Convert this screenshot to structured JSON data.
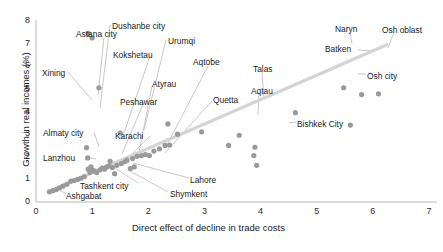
{
  "chart_data": {
    "type": "scatter",
    "title": "",
    "xlabel": "Direct effect of decline in trade costs",
    "ylabel": "Growth in real incomes (%)",
    "xlim": [
      0,
      7
    ],
    "ylim": [
      0,
      8
    ],
    "xticks": [
      "0",
      "1",
      "2",
      "3",
      "4",
      "5",
      "6",
      "7"
    ],
    "yticks": [
      "0",
      "1",
      "2",
      "3",
      "4",
      "5",
      "6",
      "7",
      "8"
    ],
    "grid": false,
    "legend": "none",
    "marker_color": "#9a9a9a",
    "trendline_color": "#d4d4d4",
    "trendline": {
      "x0": 0.22,
      "y0": 0.45,
      "x1": 6.25,
      "y1": 6.95
    },
    "labeled_points": [
      {
        "name": "Xining",
        "x": 0.93,
        "y": 7.45,
        "label_x": 42,
        "label_y": 68,
        "leader": [
          [
            68,
            72
          ],
          [
            92,
            100
          ]
        ]
      },
      {
        "name": "Astana city",
        "x": 1.0,
        "y": 7.25,
        "label_x": 76,
        "label_y": 29,
        "leader": [
          [
            104,
            38
          ],
          [
            98,
            95
          ]
        ]
      },
      {
        "name": "Dushanbe city",
        "x": 1.12,
        "y": 5.05,
        "label_x": 112,
        "label_y": 21,
        "leader": [
          [
            110,
            25
          ],
          [
            100,
            108
          ]
        ]
      },
      {
        "name": "Kokshetau",
        "x": 1.5,
        "y": 3.05,
        "label_x": 113,
        "label_y": 50,
        "leader": [
          [
            150,
            56
          ],
          [
            122,
            139
          ]
        ]
      },
      {
        "name": "Urumqi",
        "x": 2.35,
        "y": 3.45,
        "label_x": 168,
        "label_y": 36,
        "leader": [
          [
            166,
            40
          ],
          [
            144,
            130
          ]
        ]
      },
      {
        "name": "Atyrau",
        "x": 2.02,
        "y": 2.05,
        "label_x": 152,
        "label_y": 79,
        "leader": [
          [
            152,
            86
          ],
          [
            139,
            152
          ]
        ]
      },
      {
        "name": "Aqtobe",
        "x": 2.3,
        "y": 2.5,
        "label_x": 193,
        "label_y": 57,
        "leader": [
          [
            208,
            66
          ],
          [
            167,
            145
          ]
        ]
      },
      {
        "name": "Peshawar",
        "x": 1.32,
        "y": 1.8,
        "label_x": 120,
        "label_y": 97,
        "leader": [
          [
            144,
            102
          ],
          [
            122,
            154
          ]
        ]
      },
      {
        "name": "Quetta",
        "x": 1.75,
        "y": 1.55,
        "label_x": 213,
        "label_y": 95,
        "leader": [
          [
            212,
            101
          ],
          [
            165,
            153
          ]
        ]
      },
      {
        "name": "Karachi",
        "x": 1.22,
        "y": 1.45,
        "label_x": 115,
        "label_y": 131,
        "leader": [
          [
            150,
            136
          ],
          [
            126,
            160
          ]
        ]
      },
      {
        "name": "Almaty city",
        "x": 0.9,
        "y": 2.4,
        "label_x": 43,
        "label_y": 128,
        "leader": [
          [
            94,
            132
          ],
          [
            99,
            147
          ]
        ]
      },
      {
        "name": "Lanzhou",
        "x": 0.93,
        "y": 1.45,
        "label_x": 43,
        "label_y": 153,
        "leader": [
          [
            87,
            157
          ],
          [
            96,
            159
          ]
        ]
      },
      {
        "name": "Tashkent city",
        "x": 1.05,
        "y": 1.35,
        "label_x": 80,
        "label_y": 181,
        "leader": [
          [
            138,
            183
          ],
          [
            112,
            166
          ]
        ]
      },
      {
        "name": "Ashgabat",
        "x": 0.62,
        "y": 0.92,
        "label_x": 66,
        "label_y": 191,
        "leader": [
          [
            66,
            194
          ],
          [
            60,
            190
          ]
        ]
      },
      {
        "name": "Lahore",
        "x": 1.68,
        "y": 1.48,
        "label_x": 190,
        "label_y": 175,
        "leader": [
          [
            189,
            178
          ],
          [
            133,
            163
          ]
        ]
      },
      {
        "name": "Shymkent",
        "x": 1.4,
        "y": 1.25,
        "label_x": 170,
        "label_y": 189,
        "leader": [
          [
            168,
            192
          ],
          [
            128,
            170
          ]
        ]
      },
      {
        "name": "Talas",
        "x": 3.62,
        "y": 2.95,
        "label_x": 253,
        "label_y": 64,
        "leader": [
          [
            262,
            72
          ],
          [
            264,
            98
          ]
        ]
      },
      {
        "name": "Aqtau",
        "x": 3.43,
        "y": 2.5,
        "label_x": 251,
        "label_y": 86,
        "leader": [
          [
            259,
            93
          ],
          [
            258,
            115
          ]
        ]
      },
      {
        "name": "Bishkek City",
        "x": 3.93,
        "y": 1.62,
        "label_x": 297,
        "label_y": 119,
        "leader": [
          [
            296,
            122
          ],
          [
            289,
            123
          ]
        ]
      },
      {
        "name": "Naryn",
        "x": 5.48,
        "y": 5.05,
        "label_x": 335,
        "label_y": 24,
        "leader": [
          [
            350,
            32
          ],
          [
            352,
            44
          ]
        ]
      },
      {
        "name": "Batken",
        "x": 5.8,
        "y": 4.75,
        "label_x": 325,
        "label_y": 44,
        "leader": [
          [
            358,
            50
          ],
          [
            374,
            51
          ]
        ]
      },
      {
        "name": "Osh oblast",
        "x": 6.1,
        "y": 4.78,
        "label_x": 382,
        "label_y": 25,
        "leader": [
          [
            394,
            32
          ],
          [
            388,
            48
          ]
        ]
      },
      {
        "name": "Osh city",
        "x": 5.6,
        "y": 3.4,
        "label_x": 367,
        "label_y": 71,
        "leader": [
          [
            366,
            74
          ],
          [
            358,
            74
          ]
        ]
      }
    ],
    "all_points": [
      {
        "x": 0.24,
        "y": 0.45
      },
      {
        "x": 0.3,
        "y": 0.5
      },
      {
        "x": 0.36,
        "y": 0.55
      },
      {
        "x": 0.42,
        "y": 0.62
      },
      {
        "x": 0.48,
        "y": 0.7
      },
      {
        "x": 0.55,
        "y": 0.78
      },
      {
        "x": 0.62,
        "y": 0.92
      },
      {
        "x": 0.68,
        "y": 0.95
      },
      {
        "x": 0.74,
        "y": 1.0
      },
      {
        "x": 0.8,
        "y": 1.05
      },
      {
        "x": 0.86,
        "y": 1.12
      },
      {
        "x": 0.9,
        "y": 2.4
      },
      {
        "x": 0.92,
        "y": 1.95
      },
      {
        "x": 0.93,
        "y": 1.45
      },
      {
        "x": 0.93,
        "y": 7.45
      },
      {
        "x": 0.96,
        "y": 1.3
      },
      {
        "x": 0.98,
        "y": 1.55
      },
      {
        "x": 1.0,
        "y": 7.25
      },
      {
        "x": 1.02,
        "y": 1.4
      },
      {
        "x": 1.05,
        "y": 1.35
      },
      {
        "x": 1.08,
        "y": 1.3
      },
      {
        "x": 1.12,
        "y": 5.05
      },
      {
        "x": 1.14,
        "y": 1.42
      },
      {
        "x": 1.18,
        "y": 1.5
      },
      {
        "x": 1.22,
        "y": 1.45
      },
      {
        "x": 1.26,
        "y": 1.55
      },
      {
        "x": 1.3,
        "y": 1.6
      },
      {
        "x": 1.32,
        "y": 1.8
      },
      {
        "x": 1.36,
        "y": 1.52
      },
      {
        "x": 1.4,
        "y": 1.25
      },
      {
        "x": 1.44,
        "y": 1.62
      },
      {
        "x": 1.5,
        "y": 3.05
      },
      {
        "x": 1.52,
        "y": 1.7
      },
      {
        "x": 1.58,
        "y": 1.78
      },
      {
        "x": 1.62,
        "y": 1.85
      },
      {
        "x": 1.68,
        "y": 1.48
      },
      {
        "x": 1.72,
        "y": 1.92
      },
      {
        "x": 1.75,
        "y": 1.55
      },
      {
        "x": 1.8,
        "y": 2.02
      },
      {
        "x": 1.88,
        "y": 2.05
      },
      {
        "x": 1.95,
        "y": 2.1
      },
      {
        "x": 2.02,
        "y": 2.05
      },
      {
        "x": 2.1,
        "y": 2.25
      },
      {
        "x": 2.2,
        "y": 2.35
      },
      {
        "x": 2.3,
        "y": 2.5
      },
      {
        "x": 2.35,
        "y": 3.45
      },
      {
        "x": 2.38,
        "y": 2.52
      },
      {
        "x": 2.52,
        "y": 3.0
      },
      {
        "x": 2.95,
        "y": 3.1
      },
      {
        "x": 3.43,
        "y": 2.5
      },
      {
        "x": 3.62,
        "y": 2.95
      },
      {
        "x": 3.88,
        "y": 2.05
      },
      {
        "x": 3.9,
        "y": 2.42
      },
      {
        "x": 3.93,
        "y": 1.62
      },
      {
        "x": 4.62,
        "y": 3.95
      },
      {
        "x": 5.48,
        "y": 5.05
      },
      {
        "x": 5.6,
        "y": 3.4
      },
      {
        "x": 5.8,
        "y": 4.75
      },
      {
        "x": 6.1,
        "y": 4.78
      }
    ]
  }
}
